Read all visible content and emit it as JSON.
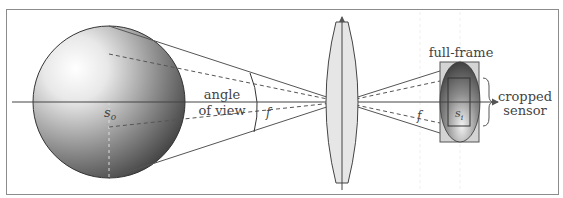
{
  "diagram": {
    "labels": {
      "object_distance": "s",
      "object_distance_sub": "o",
      "image_distance": "s",
      "image_distance_sub": "i",
      "angle_of_view_line1": "angle",
      "angle_of_view_line2": "of view",
      "focal_length_left": "f",
      "focal_length_right": "f",
      "full_frame": "full-frame",
      "cropped_sensor_line1": "cropped",
      "cropped_sensor_line2": "sensor"
    },
    "colors": {
      "frame": "#8c8c8c",
      "lines": "#555555",
      "lens_fill": "#e6e6e6",
      "sensor_fill": "#d4d4d4",
      "text": "#444444"
    }
  }
}
